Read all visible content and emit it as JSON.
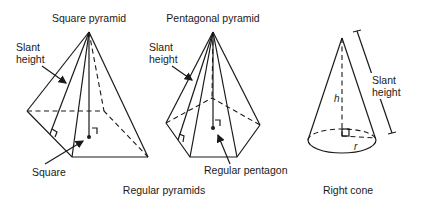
{
  "figures": {
    "square_pyramid": {
      "title": "Square pyramid",
      "slant_label_1": "Slant",
      "slant_label_2": "height",
      "base_label": "Square"
    },
    "pentagonal_pyramid": {
      "title": "Pentagonal pyramid",
      "slant_label_1": "Slant",
      "slant_label_2": "height",
      "base_label": "Regular pentagon"
    },
    "right_cone": {
      "slant_label_1": "Slant",
      "slant_label_2": "height",
      "height_label": "h",
      "radius_label": "r"
    }
  },
  "captions": {
    "pyramids": "Regular pyramids",
    "cone": "Right cone"
  },
  "colors": {
    "line": "#1a1a1a",
    "background": "#ffffff"
  }
}
